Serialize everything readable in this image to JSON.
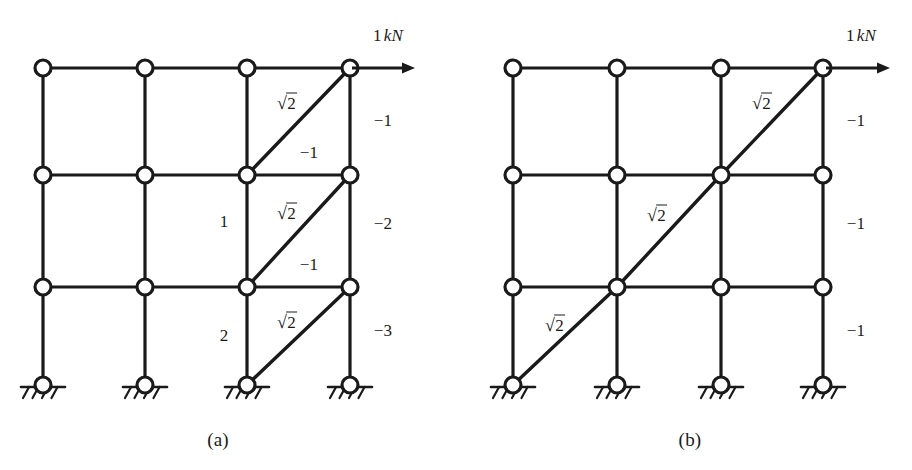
{
  "figure": {
    "background_color": "#ffffff",
    "line_color": "#1a1a1a"
  },
  "panels": [
    {
      "id": "a",
      "caption": "(a)",
      "caption_pos": {
        "x": 218,
        "y": 440
      },
      "load": {
        "label_value": "1",
        "label_unit": "kN",
        "label_pos": {
          "x": 388,
          "y": 36
        },
        "arrow": {
          "x1": 352,
          "y1": 68,
          "x2": 415,
          "y2": 68
        }
      },
      "grid": {
        "columns_x": [
          43,
          145,
          247,
          350
        ],
        "rows_y": [
          68,
          175,
          287
        ],
        "base_y": 385
      },
      "nodes": [
        {
          "x": 43,
          "y": 68,
          "type": "joint"
        },
        {
          "x": 145,
          "y": 68,
          "type": "joint"
        },
        {
          "x": 247,
          "y": 68,
          "type": "joint"
        },
        {
          "x": 350,
          "y": 68,
          "type": "joint"
        },
        {
          "x": 43,
          "y": 175,
          "type": "joint"
        },
        {
          "x": 145,
          "y": 175,
          "type": "joint"
        },
        {
          "x": 247,
          "y": 175,
          "type": "joint"
        },
        {
          "x": 350,
          "y": 175,
          "type": "joint"
        },
        {
          "x": 43,
          "y": 287,
          "type": "joint"
        },
        {
          "x": 145,
          "y": 287,
          "type": "joint"
        },
        {
          "x": 247,
          "y": 287,
          "type": "joint"
        },
        {
          "x": 350,
          "y": 287,
          "type": "joint"
        },
        {
          "x": 43,
          "y": 385,
          "type": "support"
        },
        {
          "x": 145,
          "y": 385,
          "type": "support"
        },
        {
          "x": 247,
          "y": 385,
          "type": "support"
        },
        {
          "x": 350,
          "y": 385,
          "type": "support"
        }
      ],
      "beams": [
        {
          "x1": 43,
          "y1": 68,
          "x2": 350,
          "y2": 68
        },
        {
          "x1": 43,
          "y1": 175,
          "x2": 350,
          "y2": 175
        },
        {
          "x1": 43,
          "y1": 287,
          "x2": 350,
          "y2": 287
        }
      ],
      "columns": [
        {
          "x1": 43,
          "y1": 68,
          "x2": 43,
          "y2": 385
        },
        {
          "x1": 145,
          "y1": 68,
          "x2": 145,
          "y2": 385
        },
        {
          "x1": 247,
          "y1": 68,
          "x2": 247,
          "y2": 385
        },
        {
          "x1": 350,
          "y1": 68,
          "x2": 350,
          "y2": 385
        }
      ],
      "diagonals": [
        {
          "x1": 247,
          "y1": 175,
          "x2": 350,
          "y2": 68
        },
        {
          "x1": 247,
          "y1": 287,
          "x2": 350,
          "y2": 175
        },
        {
          "x1": 247,
          "y1": 385,
          "x2": 350,
          "y2": 287
        }
      ],
      "member_labels": [
        {
          "text": "sqrt2",
          "value": "2",
          "x": 287,
          "y": 103,
          "kind": "diagonal-force"
        },
        {
          "text": "sqrt2",
          "value": "2",
          "x": 287,
          "y": 213,
          "kind": "diagonal-force"
        },
        {
          "text": "sqrt2",
          "value": "2",
          "x": 287,
          "y": 322,
          "kind": "diagonal-force"
        },
        {
          "text": "-1",
          "value": "−1",
          "x": 309,
          "y": 153,
          "kind": "beam-force"
        },
        {
          "text": "-1",
          "value": "−1",
          "x": 309,
          "y": 265,
          "kind": "beam-force"
        },
        {
          "text": "1",
          "value": "1",
          "x": 224,
          "y": 222,
          "kind": "column-force"
        },
        {
          "text": "2",
          "value": "2",
          "x": 224,
          "y": 336,
          "kind": "column-force"
        },
        {
          "text": "-1",
          "value": "−1",
          "x": 383,
          "y": 121,
          "kind": "column-force"
        },
        {
          "text": "-2",
          "value": "−2",
          "x": 383,
          "y": 224,
          "kind": "column-force"
        },
        {
          "text": "-3",
          "value": "−3",
          "x": 383,
          "y": 331,
          "kind": "column-force"
        }
      ]
    },
    {
      "id": "b",
      "caption": "(b)",
      "caption_pos": {
        "x": 690,
        "y": 440
      },
      "load": {
        "label_value": "1",
        "label_unit": "kN",
        "label_pos": {
          "x": 861,
          "y": 36
        },
        "arrow": {
          "x1": 826,
          "y1": 68,
          "x2": 890,
          "y2": 68
        }
      },
      "grid": {
        "columns_x": [
          513,
          617,
          721,
          823
        ],
        "rows_y": [
          68,
          175,
          287
        ],
        "base_y": 385
      },
      "nodes": [
        {
          "x": 513,
          "y": 68,
          "type": "joint"
        },
        {
          "x": 617,
          "y": 68,
          "type": "joint"
        },
        {
          "x": 721,
          "y": 68,
          "type": "joint"
        },
        {
          "x": 823,
          "y": 68,
          "type": "joint"
        },
        {
          "x": 513,
          "y": 175,
          "type": "joint"
        },
        {
          "x": 617,
          "y": 175,
          "type": "joint"
        },
        {
          "x": 721,
          "y": 175,
          "type": "joint"
        },
        {
          "x": 823,
          "y": 175,
          "type": "joint"
        },
        {
          "x": 513,
          "y": 287,
          "type": "joint"
        },
        {
          "x": 617,
          "y": 287,
          "type": "joint"
        },
        {
          "x": 721,
          "y": 287,
          "type": "joint"
        },
        {
          "x": 823,
          "y": 287,
          "type": "joint"
        },
        {
          "x": 513,
          "y": 385,
          "type": "support"
        },
        {
          "x": 617,
          "y": 385,
          "type": "support"
        },
        {
          "x": 721,
          "y": 385,
          "type": "support"
        },
        {
          "x": 823,
          "y": 385,
          "type": "support"
        }
      ],
      "beams": [
        {
          "x1": 513,
          "y1": 68,
          "x2": 823,
          "y2": 68
        },
        {
          "x1": 513,
          "y1": 175,
          "x2": 823,
          "y2": 175
        },
        {
          "x1": 513,
          "y1": 287,
          "x2": 823,
          "y2": 287
        }
      ],
      "columns": [
        {
          "x1": 513,
          "y1": 68,
          "x2": 513,
          "y2": 385
        },
        {
          "x1": 617,
          "y1": 68,
          "x2": 617,
          "y2": 385
        },
        {
          "x1": 721,
          "y1": 68,
          "x2": 721,
          "y2": 385
        },
        {
          "x1": 823,
          "y1": 68,
          "x2": 823,
          "y2": 385
        }
      ],
      "diagonals": [
        {
          "x1": 513,
          "y1": 385,
          "x2": 617,
          "y2": 287
        },
        {
          "x1": 617,
          "y1": 287,
          "x2": 721,
          "y2": 175
        },
        {
          "x1": 721,
          "y1": 175,
          "x2": 823,
          "y2": 68
        }
      ],
      "member_labels": [
        {
          "text": "sqrt2",
          "value": "2",
          "x": 555,
          "y": 325,
          "kind": "diagonal-force"
        },
        {
          "text": "sqrt2",
          "value": "2",
          "x": 657,
          "y": 215,
          "kind": "diagonal-force"
        },
        {
          "text": "sqrt2",
          "value": "2",
          "x": 762,
          "y": 103,
          "kind": "diagonal-force"
        },
        {
          "text": "-1",
          "value": "−1",
          "x": 856,
          "y": 121,
          "kind": "column-force"
        },
        {
          "text": "-1",
          "value": "−1",
          "x": 856,
          "y": 224,
          "kind": "column-force"
        },
        {
          "text": "-1",
          "value": "−1",
          "x": 856,
          "y": 331,
          "kind": "column-force"
        }
      ]
    }
  ],
  "node_radius": 8,
  "support": {
    "ground_half_width": 22,
    "hatch_count": 4,
    "hatch_length": 11
  }
}
